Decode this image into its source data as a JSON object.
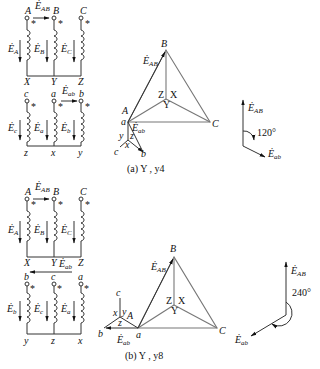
{
  "figure_a": {
    "caption": "(a) Y , y4",
    "primary": {
      "terminals": [
        "A",
        "B",
        "C"
      ],
      "ends": [
        "X",
        "Y",
        "Z"
      ],
      "emfs": [
        "E",
        "E",
        "E"
      ],
      "emf_subs": [
        "A",
        "B",
        "C"
      ],
      "line_emf": "E",
      "line_emf_sub": "AB"
    },
    "secondary": {
      "terminals": [
        "c",
        "a",
        "b"
      ],
      "ends": [
        "z",
        "x",
        "y"
      ],
      "emf_subs": [
        "c",
        "a",
        "b"
      ],
      "line_emf_sub": "ab"
    },
    "phasor": {
      "vertices": {
        "A": "A",
        "a": "a",
        "B": "B",
        "C": "C",
        "center_labels": [
          "Z",
          "X",
          "Y"
        ],
        "star": [
          "y",
          "z",
          "x",
          "c",
          "b"
        ]
      },
      "line_label_sub": "AB",
      "sec_label_sub": "ab"
    },
    "angle": {
      "label": "120°",
      "ref_sub": "AB",
      "sec_sub": "ab"
    }
  },
  "figure_b": {
    "caption": "(b) Y , y8",
    "primary": {
      "terminals": [
        "A",
        "B",
        "C"
      ],
      "ends": [
        "X",
        "Y",
        "Z"
      ],
      "emf_subs": [
        "A",
        "B",
        "C"
      ],
      "line_emf_sub": "AB"
    },
    "secondary": {
      "terminals": [
        "b",
        "c",
        "a"
      ],
      "ends": [
        "y",
        "z",
        "x"
      ],
      "emf_subs": [
        "b",
        "c",
        "a"
      ],
      "line_emf_sub": "ab"
    },
    "phasor": {
      "vertices": {
        "A": "A",
        "a": "a",
        "B": "B",
        "C": "C",
        "center_labels": [
          "Z",
          "X",
          "Y"
        ],
        "star": [
          "c",
          "x",
          "y",
          "z",
          "b"
        ]
      },
      "line_label_sub": "AB",
      "sec_label_sub": "ab"
    },
    "angle": {
      "label": "240°",
      "ref_sub": "AB",
      "sec_sub": "ab"
    }
  },
  "symbols": {
    "emf": "E",
    "dot": "·",
    "star_mark": "*"
  }
}
